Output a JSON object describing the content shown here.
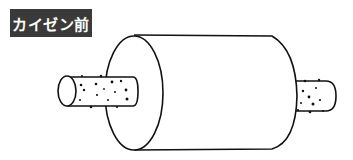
{
  "label": {
    "text": "カイゼン前",
    "background": "#3a3a3a",
    "color": "#ffffff"
  }
}
